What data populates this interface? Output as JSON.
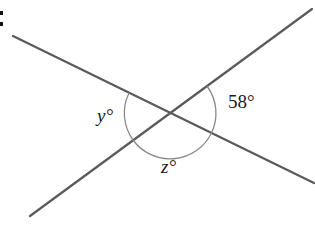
{
  "figure": {
    "corner_label": ":",
    "labels": {
      "y_angle": "y°",
      "z_angle": "z°",
      "given_angle": "58°"
    },
    "colors": {
      "line": "#5a5a5a",
      "arc": "#8a8a8a",
      "text": "#1a1a1a"
    }
  }
}
